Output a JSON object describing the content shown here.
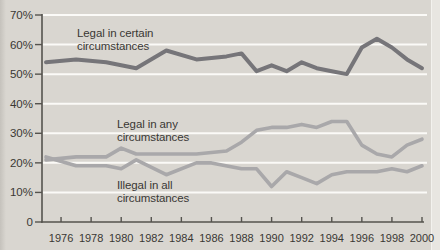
{
  "figure": {
    "annotations": {
      "certain": "Legal in certain\ncircumstances",
      "any": "Legal in any\ncircumstances",
      "illegal": "Illegal in all\ncircumstances"
    },
    "colors": {
      "background": "#d9d6d0",
      "edge_left": "#c5c2bc",
      "edge_right": "#e8e6e1"
    }
  },
  "chart_data": {
    "type": "line",
    "title": "",
    "xlabel": "",
    "ylabel": "",
    "x_range": [
      1975,
      2000
    ],
    "y_range": [
      0,
      70
    ],
    "grid": true,
    "legend_position": "inline-annotations",
    "colors": {
      "grid": "#fbfaf7",
      "axis": "#55534e",
      "tick_text": "#3a3834"
    },
    "y_ticks": [
      {
        "value": 0,
        "label": "0"
      },
      {
        "value": 10,
        "label": "10%"
      },
      {
        "value": 20,
        "label": "20%"
      },
      {
        "value": 30,
        "label": "30%"
      },
      {
        "value": 40,
        "label": "40%"
      },
      {
        "value": 50,
        "label": "50%"
      },
      {
        "value": 60,
        "label": "60%"
      },
      {
        "value": 70,
        "label": "70%"
      }
    ],
    "x_ticks": [
      1976,
      1978,
      1980,
      1982,
      1984,
      1986,
      1988,
      1990,
      1992,
      1994,
      1996,
      1998,
      2000
    ],
    "series": [
      {
        "name": "Legal in certain circumstances",
        "color": "#767579",
        "width": 4,
        "points": [
          [
            1975,
            54
          ],
          [
            1977,
            55
          ],
          [
            1979,
            54
          ],
          [
            1981,
            52
          ],
          [
            1983,
            58
          ],
          [
            1985,
            55
          ],
          [
            1987,
            56
          ],
          [
            1988,
            57
          ],
          [
            1989,
            51
          ],
          [
            1990,
            53
          ],
          [
            1991,
            51
          ],
          [
            1992,
            54
          ],
          [
            1993,
            52
          ],
          [
            1994,
            51
          ],
          [
            1995,
            50
          ],
          [
            1996,
            59
          ],
          [
            1997,
            62
          ],
          [
            1998,
            59
          ],
          [
            1999,
            55
          ],
          [
            2000,
            52
          ]
        ]
      },
      {
        "name": "Legal in any circumstances",
        "color": "#a9a8aa",
        "width": 3.6,
        "points": [
          [
            1975,
            21
          ],
          [
            1977,
            22
          ],
          [
            1979,
            22
          ],
          [
            1980,
            25
          ],
          [
            1981,
            23
          ],
          [
            1983,
            23
          ],
          [
            1985,
            23
          ],
          [
            1987,
            24
          ],
          [
            1988,
            27
          ],
          [
            1989,
            31
          ],
          [
            1990,
            32
          ],
          [
            1991,
            32
          ],
          [
            1992,
            33
          ],
          [
            1993,
            32
          ],
          [
            1994,
            34
          ],
          [
            1995,
            34
          ],
          [
            1996,
            26
          ],
          [
            1997,
            23
          ],
          [
            1998,
            22
          ],
          [
            1999,
            26
          ],
          [
            2000,
            28
          ]
        ]
      },
      {
        "name": "Illegal in all circumstances",
        "color": "#a9a8aa",
        "width": 3.6,
        "points": [
          [
            1975,
            22
          ],
          [
            1977,
            19
          ],
          [
            1979,
            19
          ],
          [
            1980,
            18
          ],
          [
            1981,
            21
          ],
          [
            1983,
            16
          ],
          [
            1985,
            20
          ],
          [
            1986,
            20
          ],
          [
            1988,
            18
          ],
          [
            1989,
            18
          ],
          [
            1990,
            12
          ],
          [
            1991,
            17
          ],
          [
            1992,
            15
          ],
          [
            1993,
            13
          ],
          [
            1994,
            16
          ],
          [
            1995,
            17
          ],
          [
            1996,
            17
          ],
          [
            1997,
            17
          ],
          [
            1998,
            18
          ],
          [
            1999,
            17
          ],
          [
            2000,
            19
          ]
        ]
      }
    ]
  }
}
